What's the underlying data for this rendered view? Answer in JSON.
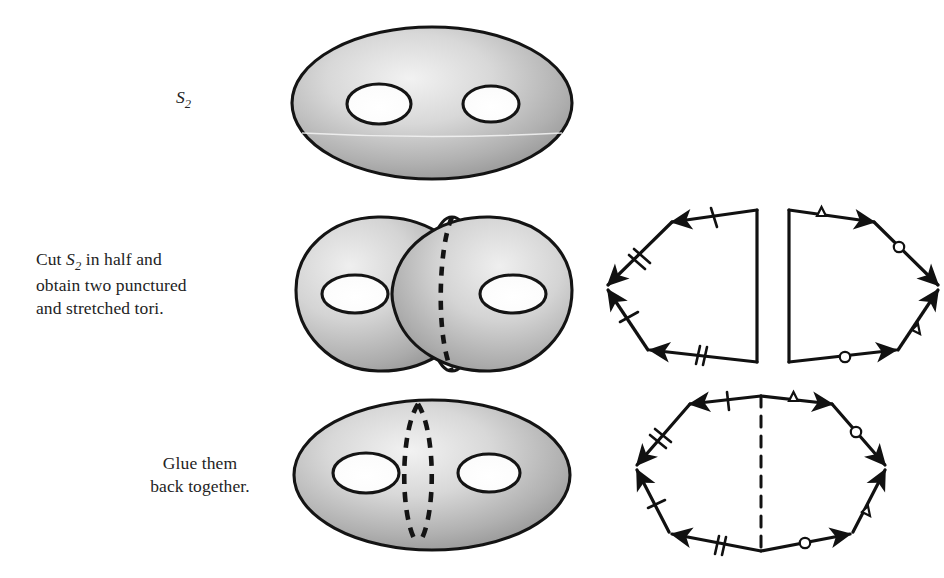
{
  "figure": {
    "background_color": "#ffffff",
    "ink_color": "#1a1a1a",
    "surface_fill_light": "#e9e9e9",
    "surface_fill_dark": "#8f8f8f"
  },
  "captions": {
    "row1": {
      "symbol": "S",
      "subscript": "2",
      "full_text": "S2"
    },
    "row2": {
      "line1_prefix": "Cut ",
      "symbol": "S",
      "subscript": "2",
      "line1_suffix": " in half and",
      "line2": "obtain two punctured",
      "line3": "and stretched tori."
    },
    "row3": {
      "line1": "Glue them",
      "line2": "back together."
    }
  },
  "rows": [
    {
      "name": "row-1-genus-2-surface",
      "left_figure": "genus-2-surface",
      "right_figure": "none",
      "holes": 2
    },
    {
      "name": "row-2-cut-halves",
      "left_figure": "two-punctured-tori",
      "right_figure": "two-pentagon-polygons",
      "holes": 2
    },
    {
      "name": "row-3-reglued",
      "left_figure": "genus-2-surface-with-cut-curve",
      "right_figure": "octagon-polygon",
      "holes": 2
    }
  ],
  "polygons": {
    "left_pentagon": {
      "name": "left-half-polygon",
      "edges": [
        {
          "id": "top",
          "ticks": 1,
          "direction": "leftward"
        },
        {
          "id": "upper-left-diagonal",
          "ticks": 2,
          "direction": "down-left"
        },
        {
          "id": "lower-left-diagonal",
          "ticks": 1,
          "direction": "up-left"
        },
        {
          "id": "bottom",
          "ticks": 2,
          "direction": "leftward"
        },
        {
          "id": "right-vertical",
          "ticks": 0,
          "direction": "none"
        }
      ],
      "vertex_arrowheads": "left-vertex-double"
    },
    "right_pentagon": {
      "name": "right-half-polygon",
      "edges": [
        {
          "id": "top",
          "marker": "triangle",
          "direction": "rightward"
        },
        {
          "id": "upper-right-diagonal",
          "marker": "circle",
          "direction": "down-right"
        },
        {
          "id": "lower-right-diagonal",
          "marker": "triangle",
          "direction": "up-right"
        },
        {
          "id": "bottom",
          "marker": "circle",
          "direction": "rightward"
        },
        {
          "id": "left-vertical",
          "marker": "none",
          "direction": "none"
        }
      ],
      "vertex_arrowheads": "right-vertex-double"
    },
    "octagon": {
      "name": "glued-octagon-polygon",
      "glue_line": "dashed-vertical",
      "edges": [
        {
          "id": "top-left",
          "ticks": 1,
          "direction": "leftward"
        },
        {
          "id": "upper-left-diagonal",
          "ticks": 2,
          "direction": "down-left"
        },
        {
          "id": "lower-left-diagonal",
          "ticks": 1,
          "direction": "up-left"
        },
        {
          "id": "bottom-left",
          "ticks": 2,
          "direction": "leftward"
        },
        {
          "id": "top-right",
          "marker": "triangle",
          "direction": "rightward"
        },
        {
          "id": "upper-right-diagonal",
          "marker": "circle",
          "direction": "down-right"
        },
        {
          "id": "lower-right-diagonal",
          "marker": "triangle",
          "direction": "up-right"
        },
        {
          "id": "bottom-right",
          "marker": "circle",
          "direction": "rightward"
        }
      ]
    }
  }
}
